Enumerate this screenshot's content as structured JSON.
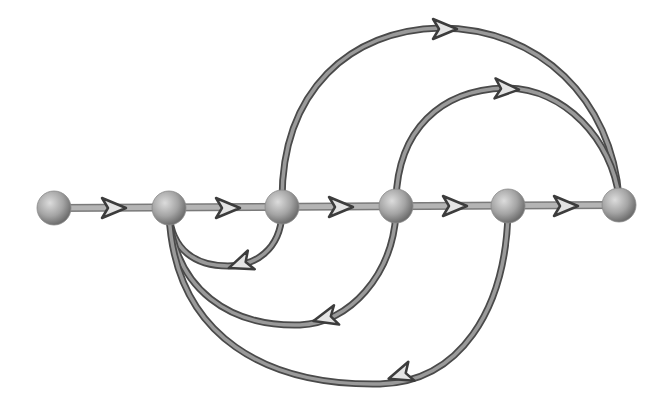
{
  "diagram": {
    "type": "signal-flow-graph",
    "colors": {
      "background": "#ffffff",
      "edge_outline": "#4a4a4a",
      "edge_fill": "#9a9a9a",
      "node_light": "#d8d8d8",
      "node_dark": "#7a7a7a",
      "arrow_fill": "#e4e4e4",
      "arrow_outline": "#3c3c3c"
    },
    "nodes": [
      {
        "id": "n1",
        "x": 54,
        "y": 208
      },
      {
        "id": "n2",
        "x": 169,
        "y": 208
      },
      {
        "id": "n3",
        "x": 282,
        "y": 207
      },
      {
        "id": "n4",
        "x": 396,
        "y": 206
      },
      {
        "id": "n5",
        "x": 508,
        "y": 206
      },
      {
        "id": "n6",
        "x": 619,
        "y": 205
      }
    ],
    "forward_edges": [
      {
        "from": "n1",
        "to": "n2",
        "arrow": {
          "x": 114,
          "y": 208
        }
      },
      {
        "from": "n2",
        "to": "n3",
        "arrow": {
          "x": 228,
          "y": 208
        }
      },
      {
        "from": "n3",
        "to": "n4",
        "arrow": {
          "x": 341,
          "y": 207
        }
      },
      {
        "from": "n4",
        "to": "n5",
        "arrow": {
          "x": 455,
          "y": 206
        }
      },
      {
        "from": "n5",
        "to": "n6",
        "arrow": {
          "x": 566,
          "y": 206
        }
      }
    ],
    "feedforward_arcs": [
      {
        "from": "n3",
        "to": "n6",
        "path": "M282,200 C282,90 350,30 440,28 C540,28 612,100 619,198",
        "arrow": {
          "x": 445,
          "y": 29,
          "angle": 0
        }
      },
      {
        "from": "n4",
        "to": "n6",
        "path": "M396,200 C398,130 440,90 505,88 C565,88 612,140 619,198",
        "arrow": {
          "x": 507,
          "y": 89,
          "angle": 3
        }
      }
    ],
    "feedback_arcs": [
      {
        "from": "n3",
        "to": "n2",
        "path": "M282,214 C280,250 255,266 228,266 C195,266 172,250 169,214",
        "arrow": {
          "x": 240,
          "y": 264,
          "angle": 160
        }
      },
      {
        "from": "n4",
        "to": "n2",
        "path": "M396,214 C392,275 350,323 300,325 C230,327 175,290 169,214",
        "arrow": {
          "x": 325,
          "y": 318,
          "angle": 165
        }
      },
      {
        "from": "n5",
        "to": "n2",
        "path": "M508,214 C505,310 460,382 380,384 C270,386 175,340 169,214",
        "arrow": {
          "x": 400,
          "y": 375,
          "angle": 162
        }
      }
    ]
  }
}
